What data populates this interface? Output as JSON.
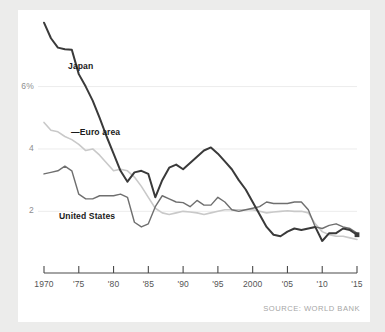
{
  "chart_data": {
    "type": "line",
    "title": "",
    "subtitle": "",
    "xlabel": "",
    "ylabel": "",
    "xlim": [
      1970,
      2015
    ],
    "ylim": [
      0.6,
      8.2
    ],
    "grid": true,
    "grid_axis": "y",
    "legend_position": "inline-annotations",
    "source_note": "SOURCE: WORLD BANK",
    "y_ticks": [
      {
        "value": 6,
        "label": "6%"
      },
      {
        "value": 4,
        "label": "4"
      },
      {
        "value": 2,
        "label": "2"
      }
    ],
    "x_ticks": [
      {
        "value": 1970,
        "label": "1970"
      },
      {
        "value": 1975,
        "label": "'75"
      },
      {
        "value": 1980,
        "label": "'80"
      },
      {
        "value": 1985,
        "label": "'85"
      },
      {
        "value": 1990,
        "label": "'90"
      },
      {
        "value": 1995,
        "label": "'95"
      },
      {
        "value": 2000,
        "label": "2000"
      },
      {
        "value": 2005,
        "label": "'05"
      },
      {
        "value": 2010,
        "label": "'10"
      },
      {
        "value": 2015,
        "label": "'15"
      }
    ],
    "x": [
      1970,
      1971,
      1972,
      1973,
      1974,
      1975,
      1976,
      1977,
      1978,
      1979,
      1980,
      1981,
      1982,
      1983,
      1984,
      1985,
      1986,
      1987,
      1988,
      1989,
      1990,
      1991,
      1992,
      1993,
      1994,
      1995,
      1996,
      1997,
      1998,
      1999,
      2000,
      2001,
      2002,
      2003,
      2004,
      2005,
      2006,
      2007,
      2008,
      2009,
      2010,
      2011,
      2012,
      2013,
      2014,
      2015
    ],
    "series": [
      {
        "name": "Japan",
        "color": "#3a3a3a",
        "width": 2.0,
        "end_marker": true,
        "values": [
          8.05,
          7.55,
          7.25,
          7.2,
          7.18,
          6.4,
          6.0,
          5.55,
          5.0,
          4.4,
          3.85,
          3.3,
          2.95,
          3.25,
          3.3,
          3.2,
          2.45,
          3.0,
          3.4,
          3.5,
          3.35,
          3.55,
          3.75,
          3.95,
          4.05,
          3.85,
          3.6,
          3.35,
          3.0,
          2.7,
          2.3,
          1.9,
          1.5,
          1.25,
          1.2,
          1.35,
          1.45,
          1.4,
          1.45,
          1.5,
          1.05,
          1.3,
          1.3,
          1.45,
          1.4,
          1.25
        ]
      },
      {
        "name": "Euro area",
        "color": "#c9c9c9",
        "width": 1.6,
        "end_marker": false,
        "values": [
          4.85,
          4.6,
          4.55,
          4.4,
          4.3,
          4.15,
          3.95,
          4.0,
          3.8,
          3.55,
          3.3,
          3.35,
          3.3,
          3.1,
          2.8,
          2.45,
          2.1,
          1.95,
          1.9,
          1.95,
          2.0,
          1.98,
          1.95,
          1.9,
          1.95,
          2.0,
          2.05,
          2.05,
          2.05,
          2.05,
          2.05,
          2.0,
          1.95,
          1.98,
          2.0,
          2.02,
          2.0,
          2.0,
          1.95,
          1.6,
          1.35,
          1.25,
          1.2,
          1.2,
          1.15,
          1.1
        ]
      },
      {
        "name": "United States",
        "color": "#6f6f6f",
        "width": 1.4,
        "end_marker": false,
        "values": [
          3.2,
          3.25,
          3.3,
          3.45,
          3.3,
          2.55,
          2.4,
          2.4,
          2.5,
          2.5,
          2.5,
          2.55,
          2.45,
          1.65,
          1.5,
          1.6,
          2.15,
          2.5,
          2.4,
          2.3,
          2.28,
          2.15,
          2.35,
          2.2,
          2.2,
          2.45,
          2.3,
          2.05,
          2.0,
          2.05,
          2.1,
          2.15,
          2.3,
          2.25,
          2.25,
          2.25,
          2.3,
          2.3,
          2.05,
          1.5,
          1.45,
          1.55,
          1.6,
          1.5,
          1.45,
          1.3
        ]
      }
    ],
    "annotations": [
      {
        "name": "japan-label",
        "text": "Japan",
        "x_px": 68,
        "y_px": 61
      },
      {
        "name": "euro-area-label",
        "text": "—Euro area",
        "x_px": 71,
        "y_px": 127
      },
      {
        "name": "united-states-label",
        "text": "United States",
        "x_px": 59,
        "y_px": 211
      }
    ]
  },
  "layout": {
    "plot_left_px": 44,
    "plot_right_px": 357,
    "axis_y_px": 273,
    "tick_len_px": 7,
    "axis_color": "#4a4a4a",
    "grid_color": "#ececec"
  }
}
